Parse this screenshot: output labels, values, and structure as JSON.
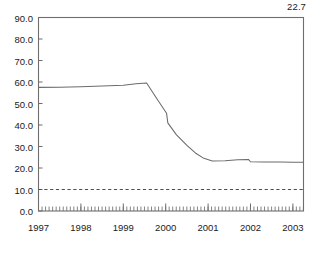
{
  "chart_data": {
    "type": "line",
    "title": "",
    "subtitle": "",
    "xlabel": "",
    "ylabel": "",
    "xlim": [
      1997.0,
      2003.25
    ],
    "ylim": [
      0.0,
      90.0
    ],
    "grid": false,
    "legend": null,
    "y_ticks": [
      0.0,
      10.0,
      20.0,
      30.0,
      40.0,
      50.0,
      60.0,
      70.0,
      80.0,
      90.0
    ],
    "y_tick_labels": [
      "0.0",
      "10.0",
      "20.0",
      "30.0",
      "40.0",
      "50.0",
      "60.0",
      "70.0",
      "80.0",
      "90.0"
    ],
    "x_ticks": [
      1997,
      1998,
      1999,
      2000,
      2001,
      2002,
      2003
    ],
    "x_tick_labels": [
      "1997",
      "1998",
      "1999",
      "2000",
      "2001",
      "2002",
      "2003"
    ],
    "x_minor_tick_interval": 0.0833,
    "annotations": [
      {
        "text": "22.7",
        "value": 22.7,
        "position": "above-top-right-corner"
      }
    ],
    "reference_lines": [
      {
        "y": 10.0,
        "style": "dashed",
        "color": "#4d4d4d"
      }
    ],
    "series": [
      {
        "name": "series-1",
        "color": "#6b6b6b",
        "x": [
          1997.0,
          1997.5,
          1998.0,
          1998.5,
          1999.0,
          1999.3,
          1999.55,
          1999.8,
          2000.02,
          2000.05,
          2000.25,
          2000.5,
          2000.7,
          2000.9,
          2001.1,
          2001.4,
          2001.7,
          2001.95,
          2002.0,
          2002.3,
          2002.7,
          2003.0,
          2003.25
        ],
        "y": [
          57.5,
          57.6,
          57.8,
          58.1,
          58.5,
          59.2,
          59.5,
          52.0,
          45.5,
          41.0,
          35.5,
          30.5,
          27.0,
          24.5,
          23.3,
          23.4,
          23.8,
          24.0,
          22.9,
          22.8,
          22.75,
          22.7,
          22.7
        ]
      }
    ]
  },
  "colors": {
    "line": "#6b6b6b",
    "frame": "#6e6e6e",
    "reference": "#4d4d4d",
    "background": "#ffffff",
    "text": "#1a1a1a"
  }
}
